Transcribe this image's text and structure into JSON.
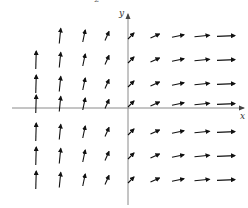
{
  "figure": {
    "top_fragment": "2",
    "axes": {
      "x_label": "x",
      "y_label": "y",
      "origin_px": [
        128,
        108
      ],
      "x_axis": {
        "from": 12,
        "to": 244,
        "y": 108
      },
      "y_axis": {
        "x": 128,
        "from": 205,
        "to": 14
      }
    },
    "arrow_color": "#111111",
    "axis_color": "#8a8a8a",
    "columns_px": [
      36,
      60,
      84,
      107,
      131,
      155,
      178,
      202,
      226
    ],
    "rows_px": [
      36,
      60,
      84,
      108,
      132,
      156,
      180
    ],
    "column_vectors": [
      {
        "dx": 0.5,
        "dy": -18
      },
      {
        "dx": 1.5,
        "dy": -15
      },
      {
        "dx": 2.5,
        "dy": -12
      },
      {
        "dx": 4,
        "dy": -9
      },
      {
        "dx": 6,
        "dy": -6
      },
      {
        "dx": 9,
        "dy": -4
      },
      {
        "dx": 12,
        "dy": -2.5
      },
      {
        "dx": 15,
        "dy": -1.5
      },
      {
        "dx": 18,
        "dy": -0.8
      }
    ],
    "missing": [
      [
        0,
        0
      ]
    ]
  }
}
